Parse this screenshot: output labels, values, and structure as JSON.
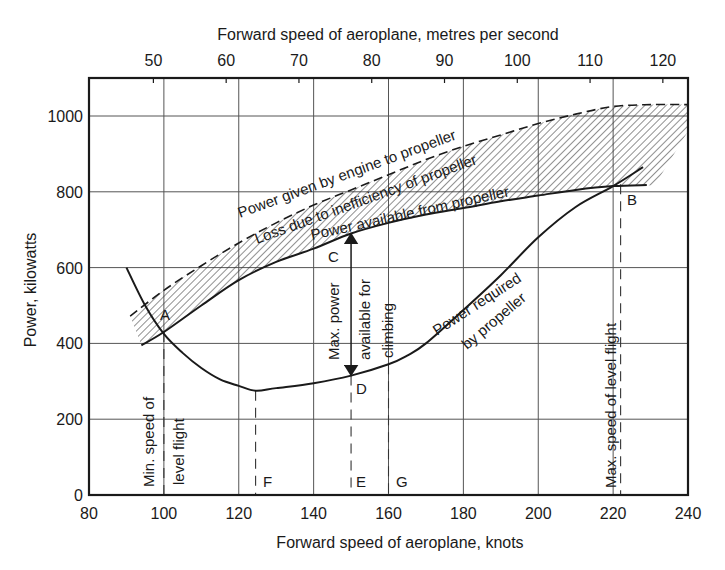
{
  "chart_data": {
    "type": "line",
    "title": "",
    "xlabel": "Forward speed of aeroplane, knots",
    "x2label": "Forward speed of aeroplane, metres per second",
    "ylabel": "Power, kilowatts",
    "xlim": [
      80,
      240
    ],
    "ylim": [
      0,
      1100
    ],
    "grid": true,
    "x_ticks": [
      80,
      100,
      120,
      140,
      160,
      180,
      200,
      220,
      240
    ],
    "x2_ticks": [
      50,
      60,
      70,
      80,
      90,
      100,
      110,
      120
    ],
    "y_ticks": [
      0,
      200,
      400,
      600,
      800,
      1000
    ],
    "series": [
      {
        "name": "Power given by engine to propeller",
        "style": "dashed",
        "x": [
          91,
          100,
          110,
          120,
          130,
          140,
          150,
          160,
          170,
          180,
          190,
          200,
          210,
          220,
          230,
          240
        ],
        "values": [
          472,
          540,
          605,
          665,
          718,
          765,
          805,
          845,
          885,
          920,
          950,
          980,
          1005,
          1025,
          1030,
          1030
        ]
      },
      {
        "name": "Power available from propeller",
        "style": "solid",
        "x": [
          94,
          100,
          110,
          120,
          130,
          140,
          150,
          160,
          170,
          180,
          190,
          200,
          210,
          220,
          229
        ],
        "values": [
          395,
          430,
          500,
          567,
          615,
          650,
          690,
          718,
          740,
          757,
          775,
          790,
          805,
          815,
          818
        ]
      },
      {
        "name": "Power required by propeller",
        "style": "solid",
        "x": [
          90,
          95,
          100,
          105,
          110,
          115,
          120,
          124.5,
          130,
          140,
          150,
          160,
          165,
          170,
          180,
          190,
          200,
          210,
          220,
          228
        ],
        "values": [
          600,
          500,
          425,
          375,
          335,
          305,
          288,
          275,
          282,
          295,
          315,
          345,
          368,
          400,
          488,
          580,
          680,
          760,
          815,
          865
        ]
      }
    ],
    "annotations": [
      {
        "label": "A",
        "x": 100,
        "y": 430,
        "note": "intersection at minimum speed of level flight"
      },
      {
        "label": "B",
        "x": 222,
        "y": 820,
        "note": "intersection at maximum speed of level flight"
      },
      {
        "label": "C",
        "x": 150,
        "y": 690
      },
      {
        "label": "D",
        "x": 150,
        "y": 315
      },
      {
        "label": "E",
        "x": 150,
        "y": 0
      },
      {
        "label": "F",
        "x": 124.5,
        "y": 0
      },
      {
        "label": "G",
        "x": 160,
        "y": 0
      }
    ],
    "hatched_region": "Loss due to inefficiency of propeller (between engine power and propeller power available)",
    "vertical_dashed_lines_knots": [
      100,
      124.5,
      150,
      160,
      222
    ],
    "arrow": {
      "x": 150,
      "from": 315,
      "to": 690,
      "label": "Max. power available for climbing"
    }
  },
  "labels": {
    "top_axis_title": "Forward speed of aeroplane, metres per second",
    "bottom_axis_title": "Forward speed of aeroplane, knots",
    "y_axis_title": "Power, kilowatts",
    "engine_curve": "Power given by engine to propeller",
    "loss_band": "Loss due to inefficiency of propeller",
    "available_curve": "Power available from propeller",
    "required_line1": "Power required",
    "required_line2": "by propeller",
    "max_power_line1": "Max. power",
    "max_power_line2": "available for",
    "max_power_line3": "climbing",
    "min_speed_line1": "Min. speed of",
    "min_speed_line2": "level flight",
    "max_speed": "Max. speed of level flight",
    "point_a": "A",
    "point_b": "B",
    "point_c": "C",
    "point_d": "D",
    "point_e": "E",
    "point_f": "F",
    "point_g": "G"
  },
  "colors": {
    "ink": "#1a1a1a",
    "grid": "#444444",
    "background": "#ffffff"
  }
}
